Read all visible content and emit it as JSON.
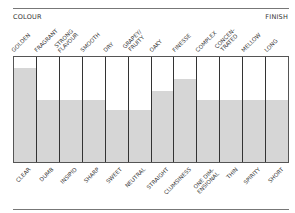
{
  "chart_data": {
    "type": "bar",
    "title": "",
    "section_labels": {
      "left": "COLOUR",
      "right": "FINISH"
    },
    "top_labels": [
      "GOLDEN",
      "FRAGRANT",
      "STRONG\nFLAVOUR",
      "SMOOTH",
      "DRY",
      "GRAPEY/\nFRUITY",
      "OAKY",
      "FINESSE",
      "COMPLEX",
      "CONCEN-\nTRATED",
      "MELLOW",
      "LONG"
    ],
    "categories": [
      "CLEAR",
      "DUMB",
      "INSIPID",
      "SHARP",
      "SWEET",
      "NEUTRAL",
      "STRAIGHT",
      "CLUMSINESS",
      "ONE DIM-\nENSIONAL",
      "THIN",
      "SPIRITY",
      "SHORT"
    ],
    "values": [
      90,
      59,
      59,
      59,
      50,
      50,
      68,
      79,
      59,
      59,
      59,
      59
    ],
    "ylim": [
      0,
      100
    ],
    "xlabel": "",
    "ylabel": "",
    "grid": false,
    "legend": null,
    "colors": {
      "fill": "#d6d6d6",
      "divider": "#333333",
      "rule": "#777777"
    }
  }
}
